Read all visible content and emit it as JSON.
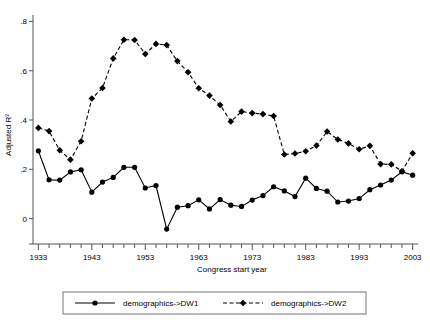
{
  "chart_data": {
    "type": "line",
    "title": "",
    "xlabel": "Congress start year",
    "ylabel": "Adjusted R²",
    "xlim": [
      1932,
      2004
    ],
    "ylim": [
      -0.075,
      0.81
    ],
    "grid": false,
    "legend_position": "bottom",
    "x_ticks_major": [
      1933,
      1943,
      1953,
      1963,
      1973,
      1983,
      1993,
      2003
    ],
    "x_tick_labels": [
      "1933",
      "1943",
      "1953",
      "1963",
      "1973",
      "1983",
      "1993",
      "2003"
    ],
    "x_tick_minor_step": 2,
    "y_ticks": [
      0,
      0.2,
      0.4,
      0.6,
      0.8
    ],
    "y_tick_labels": [
      "0",
      ".2",
      ".4",
      ".6",
      ".8"
    ],
    "x": [
      1933,
      1935,
      1937,
      1939,
      1941,
      1943,
      1945,
      1947,
      1949,
      1951,
      1953,
      1955,
      1957,
      1959,
      1961,
      1963,
      1965,
      1967,
      1969,
      1971,
      1973,
      1975,
      1977,
      1979,
      1981,
      1983,
      1985,
      1987,
      1989,
      1991,
      1993,
      1995,
      1997,
      1999,
      2001,
      2003
    ],
    "series": [
      {
        "name": "demographics->DW1",
        "marker": "circle",
        "linestyle": "solid",
        "color": "#000000",
        "values": [
          0.275,
          0.157,
          0.156,
          0.189,
          0.198,
          0.107,
          0.148,
          0.167,
          0.208,
          0.208,
          0.124,
          0.134,
          -0.043,
          0.046,
          0.052,
          0.076,
          0.039,
          0.077,
          0.054,
          0.049,
          0.075,
          0.093,
          0.129,
          0.112,
          0.089,
          0.164,
          0.122,
          0.111,
          0.067,
          0.071,
          0.081,
          0.117,
          0.136,
          0.156,
          0.19,
          0.176
        ]
      },
      {
        "name": "demographics->DW2",
        "marker": "diamond",
        "linestyle": "dashed",
        "color": "#000000",
        "values": [
          0.368,
          0.355,
          0.277,
          0.239,
          0.314,
          0.487,
          0.53,
          0.65,
          0.726,
          0.725,
          0.668,
          0.709,
          0.704,
          0.639,
          0.594,
          0.529,
          0.499,
          0.461,
          0.394,
          0.434,
          0.428,
          0.424,
          0.416,
          0.26,
          0.264,
          0.273,
          0.296,
          0.353,
          0.321,
          0.305,
          0.281,
          0.295,
          0.221,
          0.22,
          0.192,
          0.265
        ]
      }
    ]
  },
  "legend": {
    "items": [
      {
        "label": "demographics->DW1",
        "marker": "circle",
        "linestyle": "solid"
      },
      {
        "label": "demographics->DW2",
        "marker": "diamond",
        "linestyle": "dashed"
      }
    ]
  }
}
